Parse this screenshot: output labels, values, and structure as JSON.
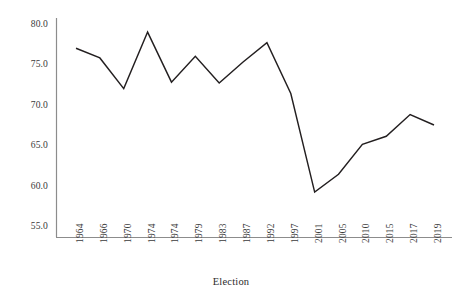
{
  "chart_data": {
    "type": "line",
    "title": "",
    "xlabel": "Election",
    "ylabel": "",
    "categories": [
      "1964",
      "1966",
      "1970",
      "1974",
      "1974",
      "1979",
      "1983",
      "1987",
      "1992",
      "1997",
      "2001",
      "2005",
      "2010",
      "2015",
      "2017",
      "2019"
    ],
    "values": [
      77.0,
      75.8,
      72.0,
      79.0,
      72.8,
      76.0,
      72.7,
      75.3,
      77.7,
      71.4,
      59.2,
      61.4,
      65.1,
      66.1,
      68.8,
      67.5
    ],
    "ylim": [
      54.0,
      81.0
    ],
    "yticks": [
      "80.0",
      "75.0",
      "70.0",
      "65.0",
      "60.0",
      "55.0"
    ],
    "ytick_values": [
      80.0,
      75.0,
      70.0,
      65.0,
      60.0,
      55.0
    ],
    "grid": false,
    "legend": null,
    "line_color": "#231f20",
    "axis_color": "#8c8c8c"
  },
  "axis": {
    "x_title": "Election"
  },
  "caption": {
    "text": ""
  }
}
